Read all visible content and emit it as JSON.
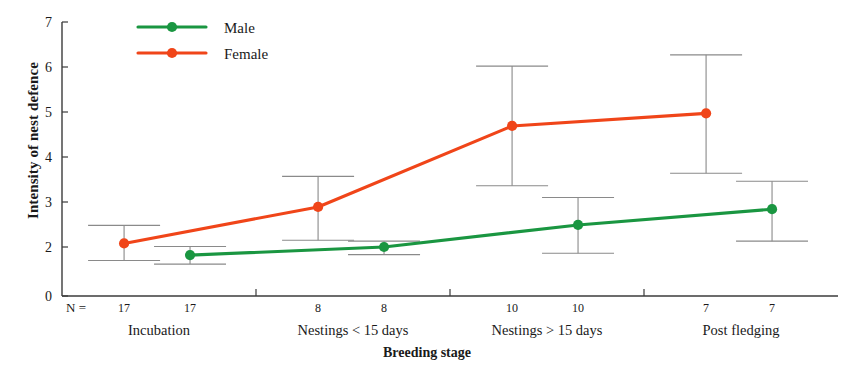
{
  "chart_data": {
    "type": "line",
    "title": "",
    "xlabel": "Breeding stage",
    "ylabel": "Intensity of nest defence",
    "ylim": [
      0,
      7
    ],
    "yticks": [
      0,
      2,
      3,
      4,
      5,
      6,
      7
    ],
    "ytick_labels": [
      "0",
      "2",
      "3",
      "4",
      "5",
      "6",
      "7"
    ],
    "grid": false,
    "legend_position": "top-left",
    "categories": [
      "Incubation",
      "Nestings < 15 days",
      "Nestings > 15 days",
      "Post fledging"
    ],
    "n_prefix": "N =",
    "series": [
      {
        "name": "Male",
        "color": "#1a9641",
        "values": [
          1.82,
          2.0,
          2.49,
          2.84
        ],
        "ci_lower": [
          1.62,
          1.83,
          1.86,
          2.13
        ],
        "ci_upper": [
          2.01,
          2.13,
          3.1,
          3.46
        ],
        "n": [
          17,
          8,
          10,
          7
        ]
      },
      {
        "name": "Female",
        "color": "#f04519",
        "values": [
          2.08,
          2.89,
          4.69,
          4.97
        ],
        "ci_lower": [
          1.7,
          2.15,
          3.36,
          3.64
        ],
        "ci_upper": [
          2.48,
          3.57,
          6.02,
          6.27
        ],
        "n": [
          17,
          8,
          10,
          7
        ]
      }
    ]
  },
  "legend": {
    "items": [
      {
        "label": "Male",
        "color": "#1a9641"
      },
      {
        "label": "Female",
        "color": "#f04519"
      }
    ]
  },
  "axes": {
    "y_title": "Intensity of nest defence",
    "x_title": "Breeding stage",
    "n_label": "N ="
  }
}
